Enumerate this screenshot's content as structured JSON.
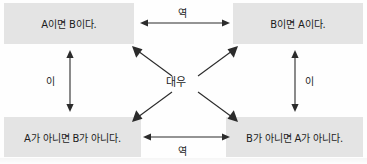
{
  "diagram": {
    "center_label": "대우",
    "box_fill_color": "#e4e4e4",
    "line_color": "#2b2b2b",
    "background_color": "#fefefe",
    "propositions": {
      "top_left": "A이면 B이다.",
      "top_right": "B이면 A이다.",
      "bottom_left": "A가 아니면 B가 아니다.",
      "bottom_right": "B가 아니면 A가 아니다."
    },
    "edge_labels": {
      "top": "역",
      "bottom": "역",
      "left": "이",
      "right": "이"
    }
  }
}
